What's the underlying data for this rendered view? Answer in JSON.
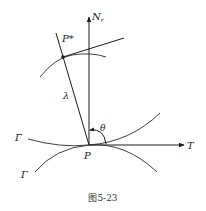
{
  "figure": {
    "caption": "图5-23",
    "labels": {
      "normal_axis": "N",
      "normal_axis_sub": "r",
      "tangent_axis": "T",
      "point_p": "P",
      "point_p_star": "P*",
      "lambda": "λ",
      "theta": "θ",
      "gamma_bar": "Γ̄",
      "gamma": "Γ"
    },
    "colors": {
      "ink": "#1a1a1a",
      "background": "#ffffff"
    }
  }
}
